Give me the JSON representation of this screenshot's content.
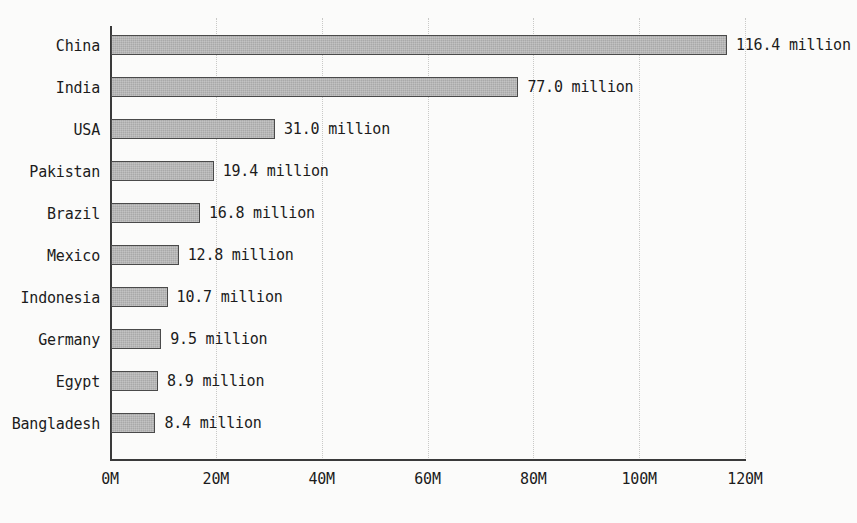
{
  "chart_data": {
    "type": "bar",
    "orientation": "horizontal",
    "title": "",
    "xlabel": "",
    "ylabel": "",
    "xlim": [
      0,
      120
    ],
    "grid": true,
    "legend": false,
    "unit_suffix": "million",
    "categories": [
      "China",
      "India",
      "USA",
      "Pakistan",
      "Brazil",
      "Mexico",
      "Indonesia",
      "Germany",
      "Egypt",
      "Bangladesh"
    ],
    "values": [
      116.4,
      77.0,
      31.0,
      19.4,
      16.8,
      12.8,
      10.7,
      9.5,
      8.9,
      8.4
    ],
    "value_labels": [
      "116.4 million",
      "77.0 million",
      "31.0 million",
      "19.4 million",
      "16.8 million",
      "12.8 million",
      "10.7 million",
      "9.5 million",
      "8.9 million",
      "8.4 million"
    ],
    "xticks": [
      0,
      20,
      40,
      60,
      80,
      100,
      120
    ],
    "xtick_labels": [
      "0M",
      "20M",
      "40M",
      "60M",
      "80M",
      "100M",
      "120M"
    ],
    "colors": {
      "bar_fill": "#a9a9a9",
      "bar_border": "#4a4a4a",
      "axis": "#3a3a3a",
      "gridline": "#c9c9c7",
      "text": "#1c1c1c",
      "background": "#fbfbfa"
    }
  }
}
